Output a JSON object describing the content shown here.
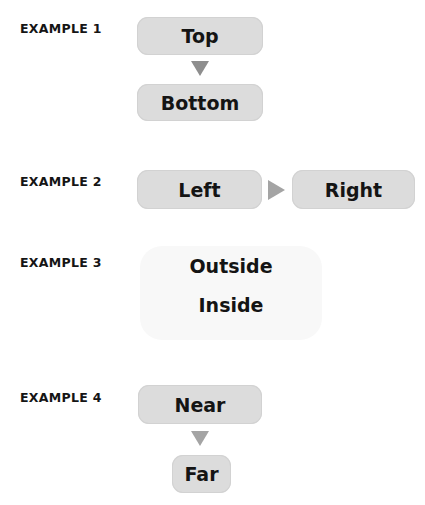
{
  "examples": [
    {
      "label": "EXAMPLE 1",
      "direction": "vertical",
      "boxes": [
        "Top",
        "Bottom"
      ],
      "connector": "arrow-down"
    },
    {
      "label": "EXAMPLE 2",
      "direction": "horizontal",
      "boxes": [
        "Left",
        "Right"
      ],
      "connector": "arrow-right"
    },
    {
      "label": "EXAMPLE 3",
      "direction": "nested",
      "texts": [
        "Outside",
        "Inside"
      ],
      "connector": "none"
    },
    {
      "label": "EXAMPLE 4",
      "direction": "vertical",
      "boxes": [
        "Near",
        "Far"
      ],
      "connector": "arrow-down"
    }
  ],
  "colors": {
    "box_fill": "#dcdcdc",
    "arrow_dark": "#8e8e8e",
    "arrow_light": "#a4a4a4",
    "faint_box": "#f8f8f8",
    "text": "#141414"
  }
}
